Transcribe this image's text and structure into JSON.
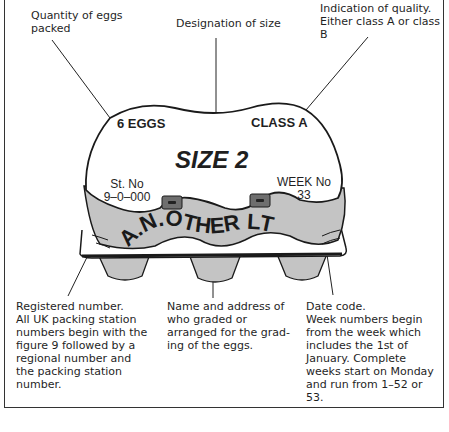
{
  "annotations": {
    "quantity": {
      "lines": [
        "Quantity of eggs",
        "packed"
      ]
    },
    "size": {
      "lines": [
        "Designation of size"
      ]
    },
    "quality": {
      "lines": [
        "Indication of quality.",
        "Either class A or class B"
      ]
    },
    "registered": {
      "lines": [
        "Registered number.",
        "All UK packing station",
        "numbers begin with the",
        "figure 9 followed by a",
        "regional number and",
        "the packing station",
        "number."
      ]
    },
    "name_address": {
      "lines": [
        "Name and address of",
        "who graded or",
        "arranged for the grad-",
        "ing of the eggs."
      ]
    },
    "date_code": {
      "lines": [
        "Date code.",
        "Week numbers begin",
        "from the week which",
        "includes the 1st of",
        "January. Complete",
        "weeks start on Monday",
        "and run from 1–52 or",
        "53."
      ]
    }
  },
  "carton": {
    "eggs_count": "6 EGGS",
    "class": "CLASS A",
    "size": "SIZE 2",
    "station_label": "St. No",
    "station_number": "9–0–000",
    "week_label": "WEEK No",
    "week_number": "33",
    "company": "A.N.OTHER LTD"
  },
  "colors": {
    "lid": "#ffffff",
    "band": "#c4c4c4",
    "outline": "#1a1a1a",
    "clasp": "#6e6e6e"
  }
}
